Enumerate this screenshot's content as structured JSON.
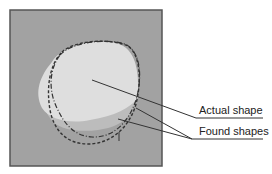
{
  "diagram": {
    "labels": {
      "actual": "Actual shape",
      "found": "Found shapes"
    },
    "colors": {
      "background": "#a0a0a0",
      "frame": "#555555",
      "blob_light": "#dedede",
      "blob_shadow": "#b8b8b8",
      "lines": "#333333"
    }
  }
}
